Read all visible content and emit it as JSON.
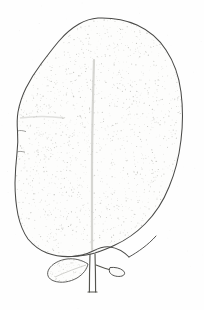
{
  "image": {
    "kind": "botanical-line-drawing",
    "subject": "leaf",
    "title": "Leaf with petiole, stipule and axillary bud",
    "width": 204,
    "height": 310,
    "background_color": "#fefefe"
  },
  "style": {
    "outline_color": "#4a4a48",
    "outline_color_soft": "#6b6b68",
    "stipple_color": "#b9b9b4",
    "vein_color": "#c8c8c4",
    "petiole_color": "#55554f",
    "outline_width": 1.05,
    "stipple_dot_radius": 0.45,
    "stipple_count": 2100
  },
  "parts": [
    {
      "id": "blade",
      "label": "Leaf blade",
      "shape": "broadly obovate",
      "margin": "entire with slight undulations",
      "apex": "broadly rounded, faintly truncate",
      "base": "attenuate into petiole",
      "texture": "fine stipple shading"
    },
    {
      "id": "midrib",
      "label": "Midrib",
      "note": "faint central vein, lighter than outline"
    },
    {
      "id": "petiole",
      "label": "Petiole",
      "note": "narrow double-lined stalk at base"
    },
    {
      "id": "stipule",
      "label": "Stipule leaflet",
      "shape": "small oval-lanceolate",
      "position": "left of petiole"
    },
    {
      "id": "bud",
      "label": "Axillary bud",
      "shape": "small elongate bud on short stalk",
      "position": "right of petiole"
    }
  ],
  "geometry": {
    "blade_path": "M 98 18 C 112 17.5 126 20 137 25 C 150 31 159 39 166 50 C 174 62 179 76 181 92 C 183 108 183 124 181 140 C 179 157 175 173 169 187 C 163 202 155 214 145 224 C 136 233 126 240 115 245 C 108 248.5 101 251 95 253 C 88 255 80 256 72 256.5 C 63 257 55 256 47 253 C 39 250 33 245 28 239 C 23 232 20 224 18 215 C 16 205 15 194 15 183 C 15.2 172 16 162 17 153 C 18 145 18 138 17.5 131 C 17 124 17 118 18 112 C 19.5 104 22 96 26 88 C 30 80 35 72 41 64 C 47 56 53 48 59 41 C 65 34 72 28 79 24 C 85 20.5 91 18.5 98 18 Z",
    "blade_base_curve": "M 72 256.5 C 80 256 87 254 93 251 C 99 248 104 246 110 247 C 118 248 124 252 129 257",
    "midrib_path": "M 94 60 C 93 95 92 135 92 170 C 92 200 92 228 92 250",
    "petiole_left": "M 90 254 C 89.6 266 89.4 278 89.4 292",
    "petiole_right": "M 95 254 C 95.4 266 95.6 278 95.6 292",
    "petiole_foot": "M 88 292 L 97 292",
    "stipule_path": "M 88 264 C 82 260 74 258 67 259 C 59 260 52 264 49 269 C 46 274 48 279 54 281 C 61 283.5 70 282 77 278 C 83 274.5 87 269 88 264 Z",
    "stipule_vein": "M 86 265 C 77 268 66 272 55 277",
    "bud_stalk": "M 96 265 C 101 267 106 269 111 270",
    "bud_path": "M 110 267.5 C 115 267 120 268 123 270.5 C 125.5 272.5 125 275 122 276 C 118 277.2 113 276 110.5 273.5 C 109 272 109 269.5 110 267.5 Z",
    "right_base_curve": "M 129 257 C 138 252 148 245 156 236",
    "left_margin_notch_1": "M 17.6 131 C 20 130 23 130.6 26 131.6",
    "left_margin_notch_2": "M 17 152 C 19.5 151 22 151.4 25 152.2",
    "shoulder_crease": "M 20 118 C 34 116 50 116 64 118"
  },
  "annotations": {
    "scale_note": "",
    "caption": ""
  }
}
